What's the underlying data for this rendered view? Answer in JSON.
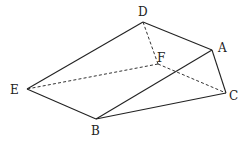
{
  "diagram": {
    "type": "polyhedron",
    "vertices": {
      "A": {
        "x": 212,
        "y": 50,
        "label": "A",
        "lx": 218,
        "ly": 52
      },
      "B": {
        "x": 96,
        "y": 119,
        "label": "B",
        "lx": 91,
        "ly": 135
      },
      "C": {
        "x": 226,
        "y": 93,
        "label": "C",
        "lx": 229,
        "ly": 100
      },
      "D": {
        "x": 143,
        "y": 22,
        "label": "D",
        "lx": 138,
        "ly": 16
      },
      "E": {
        "x": 27,
        "y": 89,
        "label": "E",
        "lx": 10,
        "ly": 94
      },
      "F": {
        "x": 158,
        "y": 64,
        "label": "F",
        "lx": 157,
        "ly": 62
      }
    },
    "solid_edges": [
      [
        "D",
        "E"
      ],
      [
        "D",
        "A"
      ],
      [
        "A",
        "B"
      ],
      [
        "A",
        "C"
      ],
      [
        "E",
        "B"
      ],
      [
        "B",
        "C"
      ]
    ],
    "dashed_edges": [
      [
        "D",
        "F"
      ],
      [
        "F",
        "E"
      ],
      [
        "F",
        "C"
      ]
    ],
    "colors": {
      "line": "#222222",
      "background": "#ffffff"
    }
  }
}
